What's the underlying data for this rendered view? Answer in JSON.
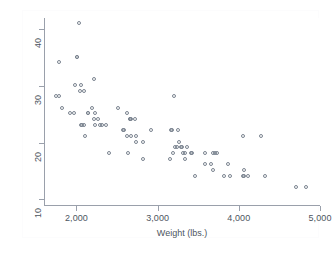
{
  "figure": {
    "background_color": "#ffffff",
    "axis_color": "#9aa0ab",
    "text_color": "#4d5560",
    "marker_color": "#7b8490"
  },
  "chart_data": {
    "type": "scatter",
    "title": "",
    "subtitle": "",
    "xlabel": "Weight (lbs.)",
    "ylabel": "Mileage (mpg)",
    "xlim": [
      1600,
      5000
    ],
    "ylim": [
      9,
      42
    ],
    "xticks": [
      2000,
      3000,
      4000,
      5000
    ],
    "xticklabels": [
      "2,000",
      "3,000",
      "4,000",
      "5,000"
    ],
    "yticks": [
      10,
      20,
      30,
      40
    ],
    "yticklabels": [
      "10",
      "20",
      "30",
      "40"
    ],
    "grid": false,
    "legend": null,
    "legend_position": "none",
    "marker_style": "open-circle",
    "n_points": 74,
    "series": [
      {
        "name": "Mileage (mpg) vs Weight (lbs.)",
        "x": [
          1800,
          1760,
          1800,
          1830,
          1930,
          1980,
          1990,
          2020,
          2020,
          2040,
          2050,
          2070,
          2070,
          2080,
          2110,
          2110,
          2120,
          2150,
          2160,
          2200,
          2230,
          2230,
          2240,
          2240,
          2280,
          2300,
          2330,
          2370,
          2410,
          2520,
          2580,
          2600,
          2630,
          2640,
          2650,
          2670,
          2670,
          2690,
          2690,
          2730,
          2750,
          2750,
          2830,
          2830,
          2930,
          3170,
          3180,
          3190,
          3200,
          3210,
          3220,
          3250,
          3260,
          3280,
          3300,
          3310,
          3330,
          3350,
          3350,
          3380,
          3420,
          3430,
          3470,
          3600,
          3600,
          3670,
          3690,
          3700,
          3720,
          3740,
          3830,
          3880,
          3900,
          4060,
          4060,
          4070,
          4080,
          4130,
          4290,
          4330,
          4720,
          4840
        ],
        "y": [
          34,
          28,
          28,
          26,
          25,
          25,
          30,
          35,
          35,
          41,
          29,
          30,
          23,
          23,
          23,
          29,
          21,
          25,
          25,
          26,
          31,
          24,
          25,
          23,
          24,
          23,
          23,
          23,
          18,
          26,
          22,
          22,
          21,
          25,
          18,
          24,
          24,
          24,
          21,
          24,
          20,
          21,
          20,
          17,
          22,
          17,
          22,
          22,
          18,
          28,
          19,
          19,
          22,
          20,
          19,
          19,
          18,
          18,
          17,
          19,
          18,
          18,
          14,
          16,
          18,
          16,
          15,
          18,
          18,
          18,
          14,
          16,
          14,
          21,
          14,
          14,
          15,
          14,
          21,
          14,
          12,
          12
        ]
      }
    ]
  },
  "axes": {
    "x_title": "Weight (lbs.)",
    "y_title": "Mileage (mpg)",
    "x_tick_labels": [
      "2,000",
      "3,000",
      "4,000",
      "5,000"
    ],
    "y_tick_labels": [
      "10",
      "20",
      "30",
      "40"
    ]
  }
}
